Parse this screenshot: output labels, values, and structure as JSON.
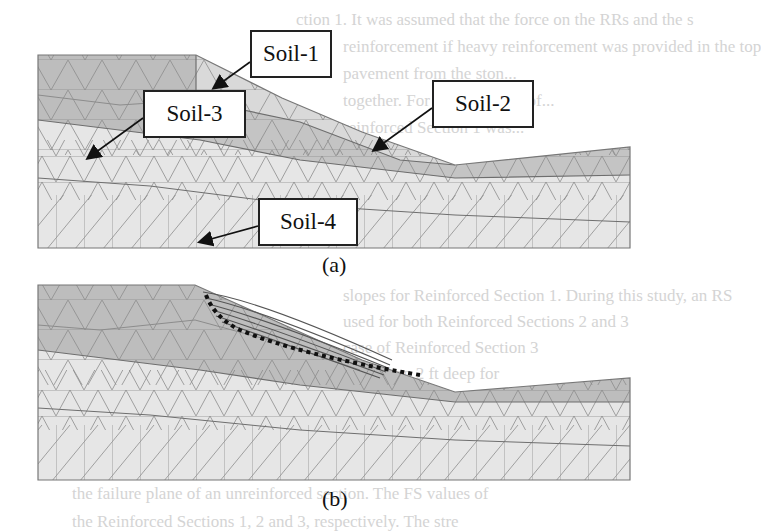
{
  "background_text": [
    {
      "text": "ction 1. It was assumed that the force on the RRs and the s",
      "x": 296,
      "y": 6
    },
    {
      "text": "reinforcement if heavy reinforcement was provided in the top",
      "x": 343,
      "y": 33
    },
    {
      "text": "pavement from the ston...",
      "x": 343,
      "y": 60
    },
    {
      "text": "together. For example, 6 ft of...",
      "x": 343,
      "y": 87
    },
    {
      "text": "reinforced Section 1 was...",
      "x": 343,
      "y": 114
    },
    {
      "text": "...analysis of...",
      "x": 343,
      "y": 160
    },
    {
      "text": "...from...",
      "x": 343,
      "y": 187
    },
    {
      "text": "slopes for Reinforced Section 1. During this study, an RS",
      "x": 343,
      "y": 282
    },
    {
      "text": "used for both Reinforced Sections 2 and 3",
      "x": 343,
      "y": 308
    },
    {
      "text": "case of Reinforced Section 3",
      "x": 343,
      "y": 334
    },
    {
      "text": "more than 2 ft deep for",
      "x": 343,
      "y": 360
    },
    {
      "text": "...",
      "x": 343,
      "y": 386
    },
    {
      "text": "the failure plane of an unreinforced section. The FS values of",
      "x": 72,
      "y": 480
    },
    {
      "text": "the Reinforced Sections 1, 2 and 3, respectively. The stre",
      "x": 72,
      "y": 508
    }
  ],
  "figure": {
    "panel_a": {
      "caption": "(a)",
      "labels": [
        {
          "text": "Soil-1",
          "box": [
            250,
            30,
            82,
            48
          ],
          "arrow_from": [
            250,
            62
          ],
          "arrow_to": [
            214,
            88
          ]
        },
        {
          "text": "Soil-2",
          "box": [
            432,
            80,
            102,
            48
          ],
          "arrow_from": [
            432,
            108
          ],
          "arrow_to": [
            374,
            150
          ]
        },
        {
          "text": "Soil-3",
          "box": [
            143,
            90,
            103,
            48
          ],
          "arrow_from": [
            143,
            118
          ],
          "arrow_to": [
            88,
            158
          ]
        },
        {
          "text": "Soil-4",
          "box": [
            258,
            198,
            100,
            48
          ],
          "arrow_from": [
            258,
            226
          ],
          "arrow_to": [
            200,
            242
          ]
        }
      ]
    },
    "panel_b": {
      "caption": "(b)",
      "annotation": "dotted failure surface with displacement vectors"
    },
    "colors": {
      "soil_dark": "#bdbdbd",
      "soil_mid": "#cfcfcf",
      "soil_light": "#e6e6e6",
      "mesh_line": "#8c8c8c",
      "layer_boundary": "#6e6e6e",
      "failure_dots": "#111111",
      "vectors": "#555555"
    }
  }
}
